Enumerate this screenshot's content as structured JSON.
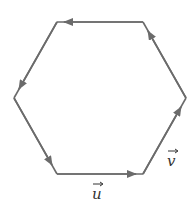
{
  "diagram": {
    "type": "regular-hexagon-vectors",
    "stroke_color": "#6b6b6b",
    "label_color": "#333333",
    "vertices": [
      {
        "name": "bottom-left",
        "x": 57,
        "y": 174
      },
      {
        "name": "bottom-right",
        "x": 143,
        "y": 174
      },
      {
        "name": "right",
        "x": 186,
        "y": 98
      },
      {
        "name": "top-right",
        "x": 143,
        "y": 22
      },
      {
        "name": "top-left",
        "x": 57,
        "y": 22
      },
      {
        "name": "left",
        "x": 14,
        "y": 98
      }
    ],
    "edges": [
      {
        "from": "bottom-left",
        "to": "bottom-right",
        "direction": "right",
        "label": "u"
      },
      {
        "from": "bottom-right",
        "to": "right",
        "direction": "up-right",
        "label": "v"
      },
      {
        "from": "right",
        "to": "top-right",
        "direction": "up-left",
        "label": ""
      },
      {
        "from": "top-right",
        "to": "top-left",
        "direction": "left",
        "label": ""
      },
      {
        "from": "top-left",
        "to": "left",
        "direction": "down-left",
        "label": ""
      },
      {
        "from": "left",
        "to": "bottom-left",
        "direction": "down-right",
        "label": ""
      }
    ],
    "labels": {
      "u": "u",
      "v": "v",
      "vector_arrow": "→"
    }
  }
}
